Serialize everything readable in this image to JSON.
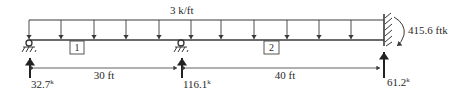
{
  "diagram": {
    "type": "continuous-beam",
    "load": {
      "label": "3 k/ft",
      "arrow_x": [
        29,
        61,
        94,
        126,
        159,
        191,
        221,
        254,
        287,
        319,
        351
      ]
    },
    "spans": [
      {
        "id": "1",
        "length_label": "30 ft"
      },
      {
        "id": "2",
        "length_label": "40 ft"
      }
    ],
    "reactions": [
      {
        "value": "32.7",
        "unit": "k",
        "support": "pin"
      },
      {
        "value": "116.1",
        "unit": "k",
        "support": "roller"
      },
      {
        "value": "61.2",
        "unit": "k",
        "support": "fixed"
      }
    ],
    "moment": {
      "label": "415.6 ftk"
    },
    "colors": {
      "line": "#3a3a3a",
      "text": "#2a2a2a",
      "background": "#ffffff"
    }
  }
}
